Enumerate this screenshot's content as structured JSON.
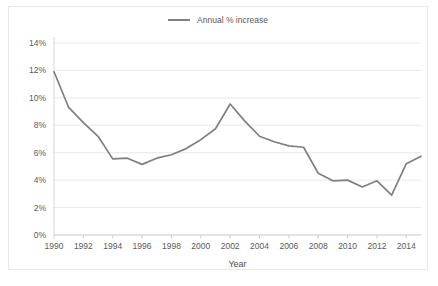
{
  "chart_data": {
    "type": "line",
    "title": "",
    "xlabel": "Year",
    "ylabel": "",
    "grid": true,
    "legend_position": "top-center",
    "xlim": [
      1990,
      2015
    ],
    "ylim": [
      0,
      14
    ],
    "ytick_labels": [
      "0%",
      "2%",
      "4%",
      "6%",
      "8%",
      "10%",
      "12%",
      "14%"
    ],
    "ytick_values": [
      0,
      2,
      4,
      6,
      8,
      10,
      12,
      14
    ],
    "xtick_labels": [
      "1990",
      "1992",
      "1994",
      "1996",
      "1998",
      "2000",
      "2002",
      "2004",
      "2006",
      "2008",
      "2010",
      "2012",
      "2014"
    ],
    "xtick_values": [
      1990,
      1992,
      1994,
      1996,
      1998,
      2000,
      2002,
      2004,
      2006,
      2008,
      2010,
      2012,
      2014
    ],
    "series": [
      {
        "name": "Annual % increase",
        "color": "#808080",
        "x": [
          1990,
          1991,
          1992,
          1993,
          1994,
          1995,
          1996,
          1997,
          1998,
          1999,
          2000,
          2001,
          2002,
          2003,
          2004,
          2005,
          2006,
          2007,
          2008,
          2009,
          2010,
          2011,
          2012,
          2013,
          2014,
          2015
        ],
        "values": [
          11.9,
          9.3,
          8.2,
          7.2,
          5.55,
          5.6,
          5.15,
          5.6,
          5.85,
          6.3,
          6.95,
          7.75,
          9.55,
          8.3,
          7.2,
          6.8,
          6.5,
          6.4,
          4.5,
          3.95,
          4.0,
          3.5,
          3.95,
          2.9,
          5.2,
          5.75
        ]
      }
    ]
  },
  "legend": {
    "entries": [
      {
        "label": "Annual % increase"
      }
    ]
  },
  "axis_titles": {
    "x": "Year"
  }
}
